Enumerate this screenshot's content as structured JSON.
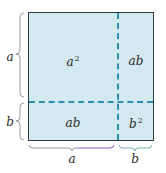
{
  "diagram": {
    "title": "",
    "concept": "(a+b)^2 = a^2 + 2ab + b^2",
    "colors": {
      "fill": "#d4e8f0",
      "border": "#2f3a40",
      "dashed_divider": "#2a8fb0",
      "brace_left": "#9a9a9a",
      "brace_bottom_a": "#8a5cc8",
      "brace_bottom_b": "#6fb89a"
    },
    "regions": {
      "top_left": {
        "base": "a",
        "exponent": "2"
      },
      "top_right": {
        "text": "ab"
      },
      "bottom_left": {
        "text": "ab"
      },
      "bottom_right": {
        "base": "b",
        "exponent": "2"
      }
    },
    "side_labels": {
      "left_top": "a",
      "left_bottom": "b",
      "bottom_left": "a",
      "bottom_right": "b"
    }
  }
}
